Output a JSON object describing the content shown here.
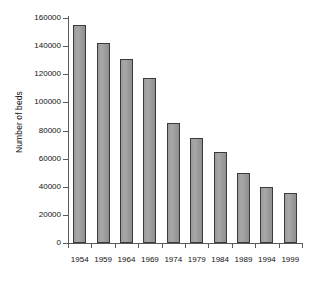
{
  "chart_data": {
    "type": "bar",
    "title": "",
    "xlabel": "",
    "ylabel": "Number of beds",
    "categories": [
      "1954",
      "1959",
      "1964",
      "1969",
      "1974",
      "1979",
      "1984",
      "1989",
      "1994",
      "1999"
    ],
    "values": [
      155000,
      142000,
      131000,
      117000,
      85000,
      74500,
      64500,
      49500,
      39500,
      35500
    ],
    "ylim": [
      0,
      160000
    ],
    "yticks": [
      0,
      20000,
      40000,
      60000,
      80000,
      100000,
      120000,
      140000,
      160000
    ],
    "ytick_labels": [
      "0",
      "20000",
      "40000",
      "60000",
      "80000",
      "100000",
      "120000",
      "140000",
      "160000"
    ],
    "grid": false,
    "legend": null,
    "bar_color": "#9b9b9b",
    "bar_border_color": "#3a3a3a",
    "axis_color": "#5a5a5a",
    "background": "#ffffff"
  }
}
